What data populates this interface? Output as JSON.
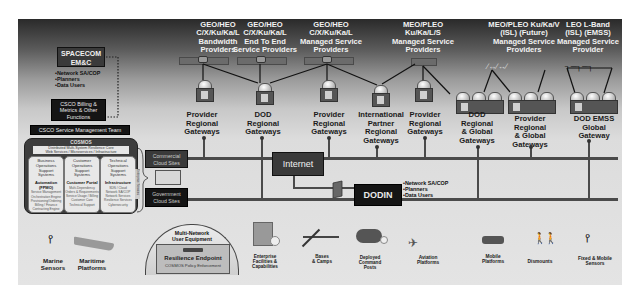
{
  "diagram": {
    "satellite_providers": [
      {
        "lines": [
          "GEO/HEO",
          "C/X/Ku/Ka/L",
          "Bandwidth",
          "Providers"
        ]
      },
      {
        "lines": [
          "GEO/HEO",
          "C/X/Ku/Ka/L",
          "End To End",
          "Service Providers"
        ]
      },
      {
        "lines": [
          "GEO/HEO",
          "C/X/Ku/Ka/L",
          "Managed Service",
          "Providers"
        ]
      },
      {
        "lines": [
          "MEO/PLEO",
          "Ku/Ka/L/S",
          "Managed Service",
          "Providers"
        ]
      },
      {
        "lines": [
          "MEO/PLEO Ku/Ka/V",
          "(ISL)  (Future)",
          "Managed Service",
          "Providers"
        ]
      },
      {
        "lines": [
          "LEO L-Band",
          "(ISL) (EMSS)",
          "Managed Service",
          "Provider"
        ]
      }
    ],
    "gateways": [
      {
        "lines": [
          "Provider",
          "Regional",
          "Gateways"
        ]
      },
      {
        "lines": [
          "DOD",
          "Regional",
          "Gateways"
        ]
      },
      {
        "lines": [
          "Provider",
          "Regional",
          "Gateways"
        ]
      },
      {
        "lines": [
          "International",
          "Partner",
          "Regional",
          "Gateways"
        ]
      },
      {
        "lines": [
          "Provider",
          "Regional",
          "Gateways"
        ]
      },
      {
        "lines": [
          "DOD",
          "Regional",
          "& Global",
          "Gateways"
        ]
      },
      {
        "lines": [
          "Provider",
          "Regional",
          "& Global",
          "Gateways"
        ]
      },
      {
        "lines": [
          "DOD EMSS",
          "Global",
          "Gateway"
        ]
      }
    ],
    "spacecom": {
      "title_lines": [
        "SPACECOM",
        "EM&C"
      ],
      "bullets": [
        "•Network SA/COP",
        "•Planners",
        "•Data Users"
      ]
    },
    "csco_billing": {
      "lines": [
        "CSCO  Billing  &",
        "Metrics & Other",
        "Functions"
      ]
    },
    "csco_team": {
      "label": "CSCO Service Management Team"
    },
    "cosmos": {
      "title": "COSMOS",
      "subtitle_lines": [
        "Distributed Multi-System Resilience Core",
        "Web Services / Microservices / Infrastructure"
      ],
      "side_label": "Enterprise Services",
      "columns": [
        {
          "header_lines": [
            "Business",
            "Operations",
            "Support",
            "Systems"
          ],
          "bold": "Automation (FPMO)",
          "details": [
            "Service Management",
            "Orchestration Engine",
            "Provisioning/Ordering",
            "Billing / Finance",
            "Contracting Engine"
          ]
        },
        {
          "header_lines": [
            "Customer",
            "Operations",
            "Support",
            "Systems"
          ],
          "bold": "Customer Portal",
          "details": [
            "Multi-Dependency",
            "Orders & Requirements",
            "Service Usage / Billing",
            "Customer Care",
            "Technical Support"
          ]
        },
        {
          "header_lines": [
            "Technical",
            "Operations",
            "Support",
            "Systems"
          ],
          "bold": "Infrastructure",
          "details": [
            "SDN / Cloud",
            "Network SA/COP",
            "Network Services",
            "Resilience Services",
            "Cybersecurity"
          ]
        }
      ]
    },
    "cloud": {
      "commercial_lines": [
        "Commercial",
        "Cloud  Sites"
      ],
      "government_lines": [
        "Government",
        "Cloud  Sites"
      ]
    },
    "internet": {
      "label": "Internet"
    },
    "dodin": {
      "label": "DODIN",
      "bullets": [
        "•Network SA/COP",
        "•Planners",
        "•Data Users"
      ]
    },
    "user_equipment": {
      "title_lines": [
        "Multi-Network",
        "User Equipment"
      ],
      "endpoint_label": "Resilience Endpoint",
      "endpoint_sub": "COSMOS Policy Enforcement"
    },
    "end_users": [
      {
        "name": "marine-sensors",
        "lines": [
          "Marine",
          "Sensors"
        ]
      },
      {
        "name": "maritime-platforms",
        "lines": [
          "Maritime",
          "Platforms"
        ]
      },
      {
        "name": "enterprise-facilities",
        "lines": [
          "Enterprise",
          "Facilities &",
          "Capabilities"
        ]
      },
      {
        "name": "bases-camps",
        "lines": [
          "Bases",
          "& Camps"
        ]
      },
      {
        "name": "deployed-command-posts",
        "lines": [
          "Deployed",
          "Command",
          "Posts"
        ]
      },
      {
        "name": "aviation-platforms",
        "lines": [
          "Aviation",
          "Platforms"
        ]
      },
      {
        "name": "mobile-platforms",
        "lines": [
          "Mobile",
          "Platforms"
        ]
      },
      {
        "name": "dismounts",
        "lines": [
          "Dismounts"
        ]
      },
      {
        "name": "fixed-mobile-sensors",
        "lines": [
          "Fixed & Mobile",
          "Sensors"
        ]
      }
    ]
  }
}
